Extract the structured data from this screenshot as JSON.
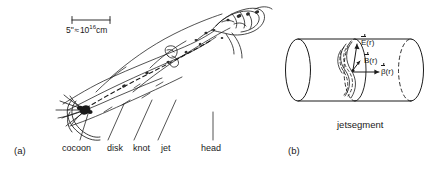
{
  "figure": {
    "background_color": "#ffffff",
    "ink_color": "#1a1a1a"
  },
  "panel_a": {
    "tag": "(a)",
    "scale_bar": {
      "value": "5",
      "unit_prime": "\"",
      "approx": "≈",
      "mantissa": "10",
      "exponent": "16",
      "length_unit": "cm"
    },
    "feature_labels": [
      {
        "name": "cocoon-label",
        "text": "cocoon"
      },
      {
        "name": "disk-label",
        "text": "disk"
      },
      {
        "name": "knot-label",
        "text": "knot"
      },
      {
        "name": "jet-label",
        "text": "jet"
      },
      {
        "name": "head-label",
        "text": "head"
      }
    ]
  },
  "panel_b": {
    "tag": "(b)",
    "caption": "jetsegment",
    "field_labels": [
      {
        "name": "electric-field-label",
        "symbol": "E",
        "arg": "(r)"
      },
      {
        "name": "magnetic-field-label",
        "symbol": "B",
        "arg": "(r)"
      },
      {
        "name": "velocity-field-label",
        "symbol": "β",
        "arg": "(r)"
      }
    ]
  }
}
